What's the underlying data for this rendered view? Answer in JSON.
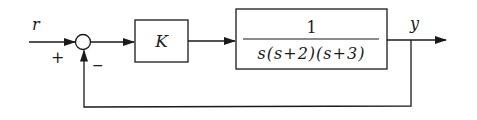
{
  "diagram": {
    "type": "feedback-control-block-diagram",
    "input_label": "r",
    "output_label": "y",
    "summing_junction": {
      "plus_sign": "+",
      "minus_sign": "−"
    },
    "controller_block": {
      "label": "K"
    },
    "plant_block": {
      "numerator": "1",
      "denominator": "s(s+2)(s+3)"
    },
    "colors": {
      "line": "#1a1a1a",
      "background": "#ffffff"
    }
  }
}
